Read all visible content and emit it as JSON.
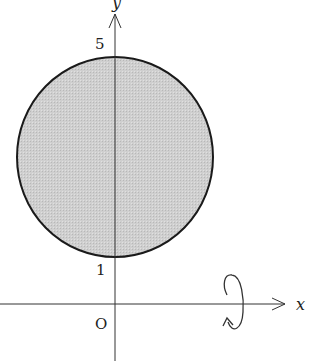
{
  "diagram": {
    "type": "solid-of-revolution",
    "axes": {
      "x_label": "x",
      "y_label": "y",
      "origin_label": "O"
    },
    "tick_labels": {
      "y_top": "5",
      "y_bottom": "1"
    },
    "region": {
      "shape": "disk",
      "center": [
        0,
        3
      ],
      "radius": 2,
      "fill_color": "#c8c8c8",
      "stroke_color": "#1a1a1a"
    },
    "rotation": {
      "axis": "x",
      "indicator": "circular-arrow-around-x-axis"
    }
  }
}
